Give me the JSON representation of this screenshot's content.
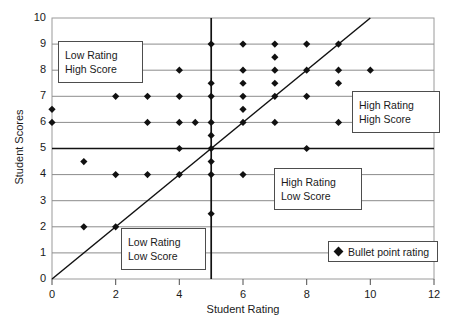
{
  "chart_data": {
    "type": "scatter",
    "title": "",
    "xlabel": "Student Rating",
    "ylabel": "Student Scores",
    "xlim": [
      0,
      12
    ],
    "ylim": [
      0,
      10
    ],
    "xticks": [
      "0",
      "2",
      "4",
      "6",
      "8",
      "10",
      "12"
    ],
    "yticks": [
      "0",
      "1",
      "2",
      "3",
      "4",
      "5",
      "6",
      "7",
      "8",
      "9",
      "10"
    ],
    "grid": "horizontal",
    "legend_position": "bottom-right",
    "series": [
      {
        "name": "Bullet point rating",
        "marker": "diamond",
        "color": "#111111",
        "points": [
          [
            0,
            6.5
          ],
          [
            0,
            6
          ],
          [
            1,
            4.5
          ],
          [
            1,
            2
          ],
          [
            2,
            7
          ],
          [
            2,
            4
          ],
          [
            2,
            2
          ],
          [
            3,
            7
          ],
          [
            3,
            6
          ],
          [
            3,
            4
          ],
          [
            4,
            8
          ],
          [
            4,
            7
          ],
          [
            4,
            6
          ],
          [
            4,
            5
          ],
          [
            4,
            4
          ],
          [
            4.5,
            6
          ],
          [
            5,
            9
          ],
          [
            5,
            7.5
          ],
          [
            5,
            7
          ],
          [
            5,
            6
          ],
          [
            5,
            5.5
          ],
          [
            5,
            5
          ],
          [
            5,
            4.5
          ],
          [
            5,
            4
          ],
          [
            5,
            2.5
          ],
          [
            6,
            9
          ],
          [
            6,
            8
          ],
          [
            6,
            7.5
          ],
          [
            6,
            7
          ],
          [
            6,
            6.5
          ],
          [
            6,
            6
          ],
          [
            6,
            4
          ],
          [
            7,
            9
          ],
          [
            7,
            8.5
          ],
          [
            7,
            8
          ],
          [
            7,
            7.5
          ],
          [
            7,
            7
          ],
          [
            7,
            6
          ],
          [
            8,
            9
          ],
          [
            8,
            8
          ],
          [
            8,
            7
          ],
          [
            8,
            5
          ],
          [
            9,
            9
          ],
          [
            9,
            8
          ],
          [
            9,
            7.5
          ],
          [
            9,
            6
          ],
          [
            10,
            8
          ]
        ]
      }
    ],
    "reference_lines": [
      {
        "name": "diagonal-identity-line",
        "type": "line",
        "from": [
          0,
          0
        ],
        "to": [
          10,
          10
        ],
        "color": "#111111"
      },
      {
        "name": "vertical-threshold-line",
        "type": "vline",
        "x": 5,
        "color": "#111111"
      },
      {
        "name": "horizontal-threshold-line",
        "type": "hline",
        "y": 5,
        "color": "#111111"
      }
    ],
    "annotations": [
      {
        "name": "low-rating-high-score",
        "line1": "Low Rating",
        "line2": "High Score",
        "quadrant": "top-left"
      },
      {
        "name": "high-rating-high-score",
        "line1": "High Rating",
        "line2": "High Score",
        "quadrant": "top-right"
      },
      {
        "name": "high-rating-low-score",
        "line1": "High Rating",
        "line2": "Low Score",
        "quadrant": "bottom-right"
      },
      {
        "name": "low-rating-low-score",
        "line1": "Low Rating",
        "line2": "Low Score",
        "quadrant": "bottom-left"
      }
    ]
  },
  "axes": {
    "x_title": "Student Rating",
    "y_title": "Student Scores",
    "x_ticks": [
      "0",
      "2",
      "4",
      "6",
      "8",
      "10",
      "12"
    ],
    "y_ticks": [
      "10",
      "9",
      "8",
      "7",
      "6",
      "5",
      "4",
      "3",
      "2",
      "1",
      "0"
    ]
  },
  "annotations": {
    "top_left": {
      "line1": "Low Rating",
      "line2": "High Score"
    },
    "top_right": {
      "line1": "High Rating",
      "line2": "High Score"
    },
    "bottom_right": {
      "line1": "High Rating",
      "line2": "Low Score"
    },
    "bottom_left": {
      "line1": "Low Rating",
      "line2": "Low Score"
    }
  },
  "legend": {
    "label": "Bullet point rating"
  },
  "colors": {
    "marker": "#111111",
    "grid": "#8c8c8c",
    "frame": "#7a7a7a",
    "reference": "#111111"
  }
}
